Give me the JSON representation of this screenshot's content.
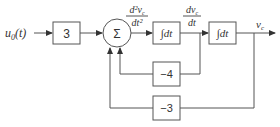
{
  "diagram": {
    "type": "block-diagram",
    "input": {
      "label_base": "u",
      "label_sub": "0",
      "label_arg": "(t)"
    },
    "blocks": [
      {
        "id": "gain_in",
        "label": "3"
      },
      {
        "id": "sum",
        "label": "Σ"
      },
      {
        "id": "int1",
        "label": "∫dt"
      },
      {
        "id": "int2",
        "label": "∫dt"
      },
      {
        "id": "fb1",
        "label": "−4"
      },
      {
        "id": "fb2",
        "label": "−3"
      }
    ],
    "signals": {
      "second_derivative": {
        "num": "d²v",
        "num_sub": "c",
        "den": "dt²"
      },
      "first_derivative": {
        "num": "dv",
        "num_sub": "c",
        "den": "dt"
      },
      "output": {
        "base": "v",
        "sub": "c"
      }
    },
    "connections": [
      "u0(t) -> 3",
      "3 -> Σ",
      "Σ -> ∫dt (d²vc/dt²)",
      "∫dt -> ∫dt (dvc/dt)",
      "∫dt -> vc (output)",
      "dvc/dt -> −4 -> Σ",
      "vc -> −3 -> Σ"
    ]
  }
}
